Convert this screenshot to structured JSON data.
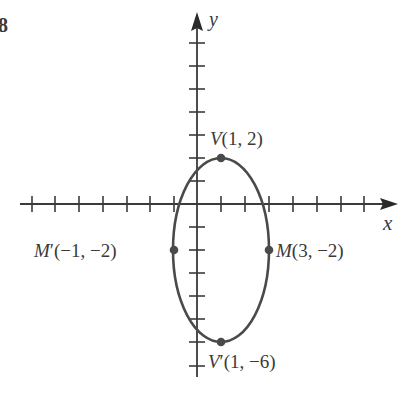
{
  "figure": {
    "number": "8",
    "x_axis_label": "x",
    "y_axis_label": "y",
    "colors": {
      "ink": "#3a3a3a",
      "curve": "#4a4a4a",
      "background": "#ffffff"
    },
    "ellipse": {
      "center": [
        1,
        -2
      ],
      "semi_axis_x": 2,
      "semi_axis_y": 4
    },
    "points": [
      {
        "id": "V",
        "name": "V",
        "prime": "",
        "coords": "(1, 2)",
        "x": 1,
        "y": 2
      },
      {
        "id": "M",
        "name": "M",
        "prime": "",
        "coords": "(3, −2)",
        "x": 3,
        "y": -2
      },
      {
        "id": "Mp",
        "name": "M",
        "prime": "′",
        "coords": "(−1, −2)",
        "x": -1,
        "y": -2
      },
      {
        "id": "Vp",
        "name": "V",
        "prime": "′",
        "coords": "(1, −6)",
        "x": 1,
        "y": -6
      }
    ],
    "x_ticks": [
      -7,
      -6,
      -5,
      -4,
      -3,
      -2,
      -1,
      1,
      2,
      3,
      4,
      5,
      6,
      7
    ],
    "y_ticks": [
      7,
      6,
      5,
      4,
      3,
      2,
      1,
      -1,
      -2,
      -3,
      -4,
      -5,
      -6,
      -7
    ]
  }
}
